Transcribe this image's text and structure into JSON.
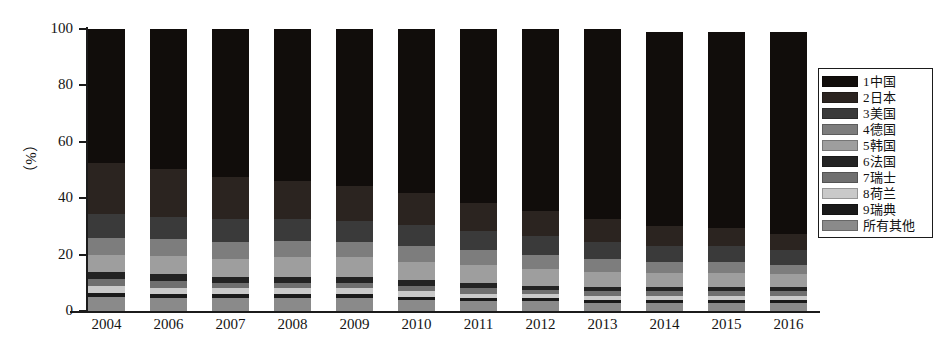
{
  "chart_data": {
    "type": "bar",
    "stacked": true,
    "stack_mode": "percent",
    "title": "",
    "subtitle": "",
    "xlabel": "",
    "ylabel": "（%）",
    "ylim": [
      0,
      100
    ],
    "yticks": [
      0,
      20,
      40,
      60,
      80,
      100
    ],
    "ytick_labels": [
      "0",
      "20",
      "40",
      "60",
      "80",
      "100"
    ],
    "grid": false,
    "legend_position": "right",
    "categories": [
      "2004",
      "2006",
      "2007",
      "2008",
      "2009",
      "2010",
      "2011",
      "2012",
      "2013",
      "2014",
      "2015",
      "2016"
    ],
    "bar_totals": [
      100,
      100,
      100,
      100,
      100,
      100,
      100,
      100,
      100,
      99,
      99,
      99
    ],
    "series": [
      {
        "name": "所有其他",
        "legend_index": 10,
        "color": "#8a8a8a",
        "values": [
          5.0,
          4.5,
          4.5,
          4.5,
          4.5,
          4.0,
          3.5,
          3.5,
          3.0,
          3.0,
          3.0,
          3.0
        ]
      },
      {
        "name": "9瑞典",
        "legend_index": 9,
        "color": "#1a1a1a",
        "values": [
          1.5,
          1.5,
          1.5,
          1.5,
          1.5,
          1.0,
          1.0,
          1.0,
          1.0,
          1.0,
          1.0,
          1.0
        ]
      },
      {
        "name": "8荷兰",
        "legend_index": 8,
        "color": "#c9c9c9",
        "values": [
          2.5,
          2.0,
          2.0,
          2.0,
          2.0,
          2.0,
          1.5,
          1.5,
          1.5,
          1.5,
          1.5,
          1.5
        ]
      },
      {
        "name": "7瑞士",
        "legend_index": 7,
        "color": "#6f6f6f",
        "values": [
          2.5,
          2.5,
          2.0,
          2.0,
          2.0,
          2.0,
          2.0,
          1.5,
          1.5,
          1.5,
          1.5,
          1.5
        ]
      },
      {
        "name": "6法国",
        "legend_index": 6,
        "color": "#232323",
        "values": [
          2.5,
          2.5,
          2.0,
          2.0,
          2.0,
          2.0,
          2.0,
          1.5,
          1.5,
          1.5,
          1.5,
          1.5
        ]
      },
      {
        "name": "5韩国",
        "legend_index": 5,
        "color": "#9e9e9e",
        "values": [
          6.0,
          6.5,
          6.5,
          7.0,
          7.0,
          6.5,
          6.5,
          6.0,
          5.5,
          5.0,
          5.0,
          4.5
        ]
      },
      {
        "name": "4德国",
        "legend_index": 4,
        "color": "#7d7d7d",
        "values": [
          6.0,
          6.0,
          6.0,
          6.0,
          5.5,
          5.5,
          5.0,
          5.0,
          4.5,
          4.0,
          4.0,
          3.5
        ]
      },
      {
        "name": "3美国",
        "legend_index": 3,
        "color": "#3a3a3a",
        "values": [
          8.5,
          8.0,
          8.0,
          7.5,
          7.5,
          7.5,
          7.0,
          6.5,
          6.0,
          5.5,
          5.5,
          5.0
        ]
      },
      {
        "name": "2日本",
        "legend_index": 2,
        "color": "#2b2420",
        "values": [
          18.0,
          17.0,
          15.0,
          13.5,
          12.5,
          11.5,
          10.0,
          9.0,
          8.0,
          7.0,
          6.5,
          6.0
        ]
      },
      {
        "name": "1中国",
        "legend_index": 1,
        "color": "#110d0b",
        "values": [
          47.5,
          49.5,
          52.5,
          54.0,
          55.5,
          58.0,
          61.5,
          64.5,
          67.5,
          69.0,
          69.5,
          71.5
        ]
      }
    ],
    "legend_entries": [
      {
        "label": "1中国",
        "color": "#110d0b"
      },
      {
        "label": "2日本",
        "color": "#2b2420"
      },
      {
        "label": "3美国",
        "color": "#3a3a3a"
      },
      {
        "label": "4德国",
        "color": "#7d7d7d"
      },
      {
        "label": "5韩国",
        "color": "#9e9e9e"
      },
      {
        "label": "6法国",
        "color": "#232323"
      },
      {
        "label": "7瑞士",
        "color": "#6f6f6f"
      },
      {
        "label": "8荷兰",
        "color": "#c9c9c9"
      },
      {
        "label": "9瑞典",
        "color": "#1a1a1a"
      },
      {
        "label": "所有其他",
        "color": "#8a8a8a"
      }
    ]
  }
}
